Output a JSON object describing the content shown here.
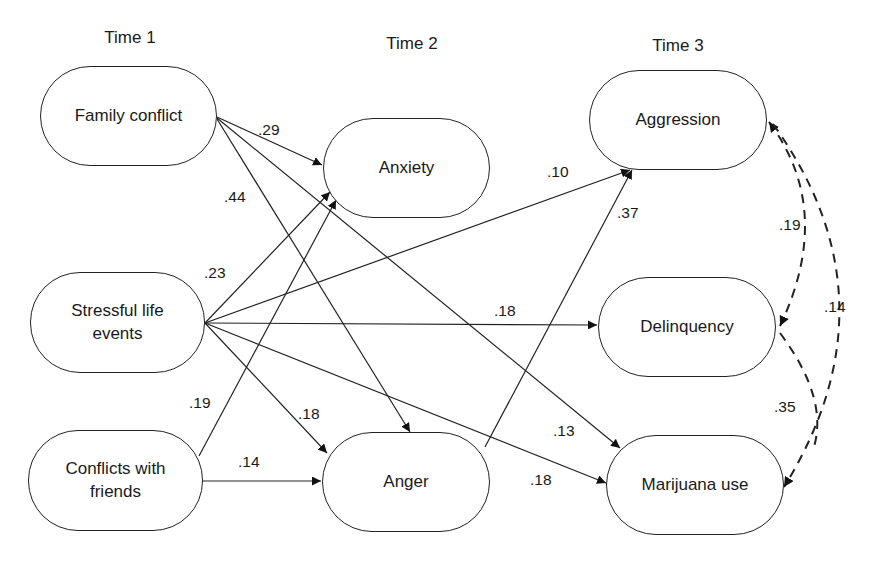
{
  "diagram": {
    "time_labels": [
      "Time 1",
      "Time 2",
      "Time 3"
    ],
    "nodes": {
      "family_conflict": "Family conflict",
      "stressful_life_events_l1": "Stressful life",
      "stressful_life_events_l2": "events",
      "conflicts_with_friends_l1": "Conflicts with",
      "conflicts_with_friends_l2": "friends",
      "anxiety": "Anxiety",
      "anger": "Anger",
      "aggression": "Aggression",
      "delinquency": "Delinquency",
      "marijuana_use": "Marijuana use"
    },
    "paths": [
      {
        "from": "Family conflict",
        "to": "Anxiety",
        "coef": ".29"
      },
      {
        "from": "Family conflict",
        "to": "Anger",
        "coef": ".44"
      },
      {
        "from": "Family conflict",
        "to": "Marijuana use",
        "coef": ".13"
      },
      {
        "from": "Stressful life events",
        "to": "Anxiety",
        "coef": ".23"
      },
      {
        "from": "Stressful life events",
        "to": "Aggression",
        "coef": ".10"
      },
      {
        "from": "Stressful life events",
        "to": "Delinquency",
        "coef": ".18"
      },
      {
        "from": "Stressful life events",
        "to": "Anger",
        "coef": ".18"
      },
      {
        "from": "Stressful life events",
        "to": "Marijuana use",
        "coef": ".18"
      },
      {
        "from": "Conflicts with friends",
        "to": "Anxiety",
        "coef": ".19"
      },
      {
        "from": "Conflicts with friends",
        "to": "Anger",
        "coef": ".14"
      },
      {
        "from": "Anger",
        "to": "Aggression",
        "coef": ".37"
      }
    ],
    "correlations": [
      {
        "a": "Aggression",
        "b": "Delinquency",
        "coef": ".19"
      },
      {
        "a": "Aggression",
        "b": "Marijuana use",
        "coef": ".14"
      },
      {
        "a": "Delinquency",
        "b": "Marijuana use",
        "coef": ".35"
      }
    ]
  }
}
